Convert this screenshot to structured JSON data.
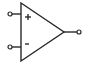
{
  "diagram": {
    "type": "op-amp-symbol",
    "stroke_color": "#2a2a2a",
    "background": "#ffffff",
    "inputs": [
      {
        "label": "+",
        "name": "non-inverting-input"
      },
      {
        "label": "-",
        "name": "inverting-input"
      }
    ],
    "output": {
      "name": "output"
    }
  }
}
